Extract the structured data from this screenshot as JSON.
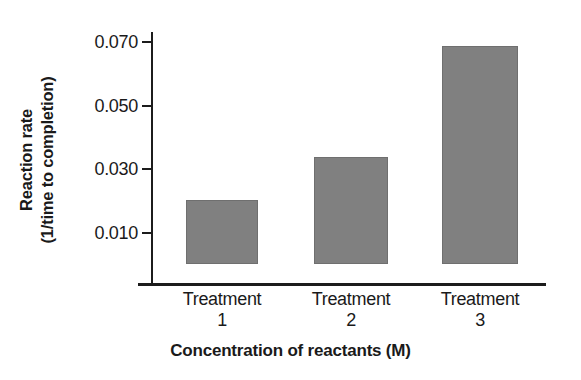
{
  "chart_data": {
    "type": "bar",
    "title": "",
    "subtitle": "",
    "categories": [
      "Treatment 1",
      "Treatment 2",
      "Treatment 3"
    ],
    "category_lines": [
      {
        "name": "Treatment",
        "number": "1"
      },
      {
        "name": "Treatment",
        "number": "2"
      },
      {
        "name": "Treatment",
        "number": "3"
      }
    ],
    "values": [
      0.02,
      0.0335,
      0.0685
    ],
    "xlabel": "Concentration of reactants (M)",
    "ylabel": "Reaction rate (1/time to completion)",
    "ylabel_line1": "Reaction rate",
    "ylabel_line2": "(1/time to completion)",
    "ytick_labels": [
      "0.010",
      "0.030",
      "0.050",
      "0.070"
    ],
    "ytick_values": [
      0.01,
      0.03,
      0.05,
      0.07
    ],
    "ylim": [
      0.0,
      0.0705
    ],
    "grid": false,
    "legend": false,
    "legend_position": "none",
    "bar_color": "#808080",
    "bar_edge_color": "#6f6f6f",
    "axis_color": "#1c1c1c",
    "background_color": "#ffffff"
  },
  "axes": {
    "y_ticks": [
      {
        "label": "0.010",
        "value": 0.01
      },
      {
        "label": "0.030",
        "value": 0.03
      },
      {
        "label": "0.050",
        "value": 0.05
      },
      {
        "label": "0.070",
        "value": 0.07
      }
    ]
  }
}
